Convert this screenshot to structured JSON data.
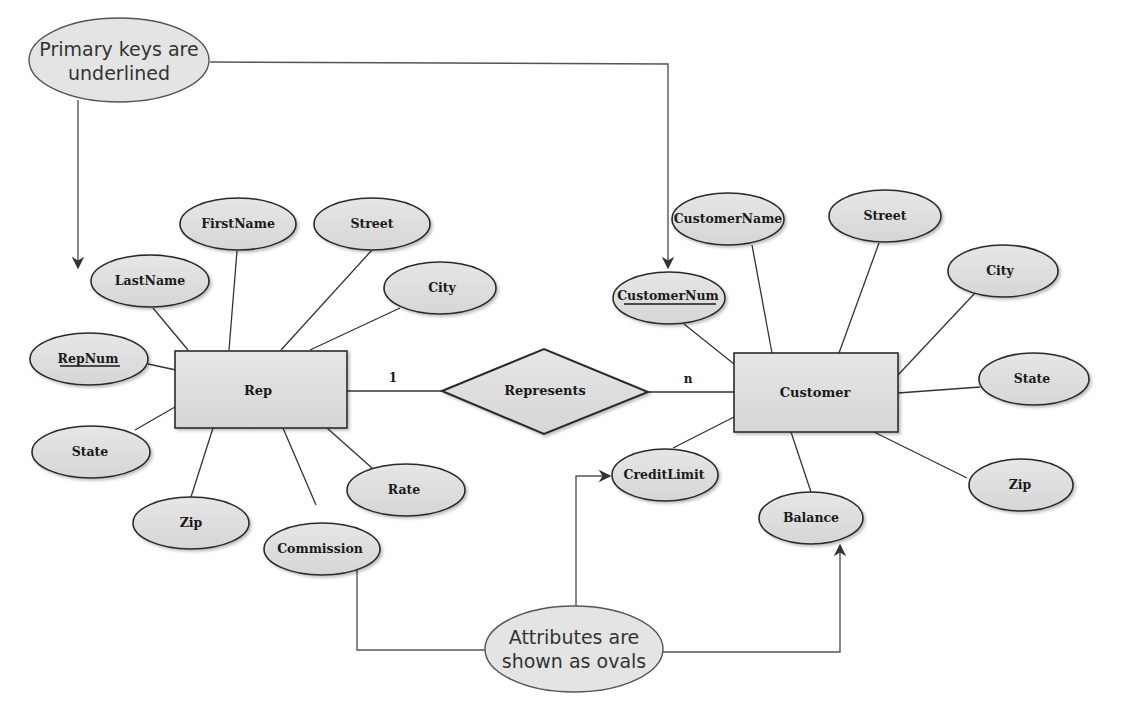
{
  "diagram": {
    "type": "entity-relationship",
    "callouts": {
      "primary_keys": {
        "line1": "Primary keys are",
        "line2": "underlined"
      },
      "attributes": {
        "line1": "Attributes are",
        "line2": "shown as ovals"
      }
    },
    "entities": {
      "rep": {
        "label": "Rep",
        "attributes": {
          "repnum": "RepNum",
          "lastname": "LastName",
          "firstname": "FirstName",
          "street": "Street",
          "city": "City",
          "state": "State",
          "zip": "Zip",
          "commission": "Commission",
          "rate": "Rate"
        },
        "primary_key": "RepNum"
      },
      "customer": {
        "label": "Customer",
        "attributes": {
          "customernum": "CustomerNum",
          "customername": "CustomerName",
          "street": "Street",
          "city": "City",
          "state": "State",
          "zip": "Zip",
          "balance": "Balance",
          "creditlimit": "CreditLimit"
        },
        "primary_key": "CustomerNum"
      }
    },
    "relationship": {
      "label": "Represents",
      "cardinality_left": "1",
      "cardinality_right": "n"
    }
  }
}
